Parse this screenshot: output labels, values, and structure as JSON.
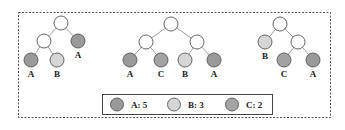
{
  "colors": {
    "A": "#9a9a9a",
    "B": "#d6d6d6",
    "C": "#a3a3a3",
    "empty": "#ffffff",
    "stroke": "#555555",
    "edge": "#888888",
    "border": "#555555"
  },
  "trees": [
    {
      "nodes": [
        {
          "id": "r",
          "x": 61,
          "y": 23,
          "type": "empty"
        },
        {
          "id": "l",
          "x": 44,
          "y": 41,
          "type": "empty"
        },
        {
          "id": "rr",
          "x": 78,
          "y": 41,
          "type": "A",
          "label": "A",
          "lx": 78,
          "ly": 58
        },
        {
          "id": "ll",
          "x": 31,
          "y": 60,
          "type": "A",
          "label": "A",
          "lx": 31,
          "ly": 77
        },
        {
          "id": "lr",
          "x": 57,
          "y": 60,
          "type": "B",
          "label": "B",
          "lx": 57,
          "ly": 77
        }
      ],
      "edges": [
        [
          "r",
          "l"
        ],
        [
          "r",
          "rr"
        ],
        [
          "l",
          "ll"
        ],
        [
          "l",
          "lr"
        ]
      ]
    },
    {
      "nodes": [
        {
          "id": "r",
          "x": 171,
          "y": 24,
          "type": "empty"
        },
        {
          "id": "l",
          "x": 146,
          "y": 42,
          "type": "empty"
        },
        {
          "id": "rr",
          "x": 197,
          "y": 42,
          "type": "empty"
        },
        {
          "id": "ll",
          "x": 130,
          "y": 60,
          "type": "A",
          "label": "A",
          "lx": 130,
          "ly": 77
        },
        {
          "id": "lr",
          "x": 161,
          "y": 60,
          "type": "C",
          "label": "C",
          "lx": 161,
          "ly": 77
        },
        {
          "id": "rl",
          "x": 185,
          "y": 60,
          "type": "B",
          "label": "B",
          "lx": 185,
          "ly": 77
        },
        {
          "id": "r2",
          "x": 214,
          "y": 60,
          "type": "A",
          "label": "A",
          "lx": 214,
          "ly": 77
        }
      ],
      "edges": [
        [
          "r",
          "l"
        ],
        [
          "r",
          "rr"
        ],
        [
          "l",
          "ll"
        ],
        [
          "l",
          "lr"
        ],
        [
          "rr",
          "rl"
        ],
        [
          "rr",
          "r2"
        ]
      ]
    },
    {
      "nodes": [
        {
          "id": "r",
          "x": 280,
          "y": 24,
          "type": "empty"
        },
        {
          "id": "l",
          "x": 265,
          "y": 42,
          "type": "B",
          "label": "B",
          "lx": 265,
          "ly": 59
        },
        {
          "id": "rr",
          "x": 298,
          "y": 42,
          "type": "empty"
        },
        {
          "id": "rl",
          "x": 284,
          "y": 60,
          "type": "C",
          "label": "C",
          "lx": 284,
          "ly": 77
        },
        {
          "id": "r2",
          "x": 313,
          "y": 60,
          "type": "A",
          "label": "A",
          "lx": 313,
          "ly": 77
        }
      ],
      "edges": [
        [
          "r",
          "l"
        ],
        [
          "r",
          "rr"
        ],
        [
          "rr",
          "rl"
        ],
        [
          "rr",
          "r2"
        ]
      ]
    }
  ],
  "legend": {
    "items": [
      {
        "key": "A",
        "text": "A: 5"
      },
      {
        "key": "B",
        "text": "B: 3"
      },
      {
        "key": "C",
        "text": "C: 2"
      }
    ]
  }
}
